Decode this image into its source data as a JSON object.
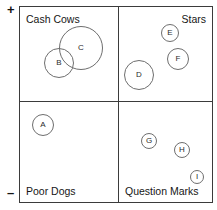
{
  "chart_data": {
    "type": "scatter",
    "title": "",
    "ylabel": "Relativer Marktanteil",
    "xlabel": "",
    "y_axis_ticks": {
      "top": "+",
      "bottom": "–"
    },
    "grid": false,
    "legend": "none",
    "quadrants": [
      {
        "key": "cash_cows",
        "label": "Cash Cows",
        "position": "top-left"
      },
      {
        "key": "stars",
        "label": "Stars",
        "position": "top-right"
      },
      {
        "key": "poor_dogs",
        "label": "Poor Dogs",
        "position": "bottom-left"
      },
      {
        "key": "question_marks",
        "label": "Question Marks",
        "position": "bottom-right"
      }
    ],
    "bubbles": [
      {
        "label": "A",
        "quadrant": "poor_dogs",
        "cx": 42,
        "cy": 124,
        "r": 11
      },
      {
        "label": "B",
        "quadrant": "cash_cows",
        "cx": 58,
        "cy": 62,
        "r": 15
      },
      {
        "label": "C",
        "quadrant": "cash_cows",
        "cx": 80,
        "cy": 47,
        "r": 22
      },
      {
        "label": "D",
        "quadrant": "stars",
        "cx": 138,
        "cy": 74,
        "r": 15
      },
      {
        "label": "E",
        "quadrant": "stars",
        "cx": 169,
        "cy": 32,
        "r": 9
      },
      {
        "label": "F",
        "quadrant": "stars",
        "cx": 177,
        "cy": 58,
        "r": 11
      },
      {
        "label": "G",
        "quadrant": "question_marks",
        "cx": 148,
        "cy": 140,
        "r": 8
      },
      {
        "label": "H",
        "quadrant": "question_marks",
        "cx": 181,
        "cy": 149,
        "r": 8
      },
      {
        "label": "I",
        "quadrant": "question_marks",
        "cx": 196,
        "cy": 176,
        "r": 7
      }
    ],
    "colors": {
      "frame": "#3b3b3b",
      "bubble_stroke": "#6e6e6e",
      "text": "#161616",
      "background": "#ffffff"
    }
  }
}
